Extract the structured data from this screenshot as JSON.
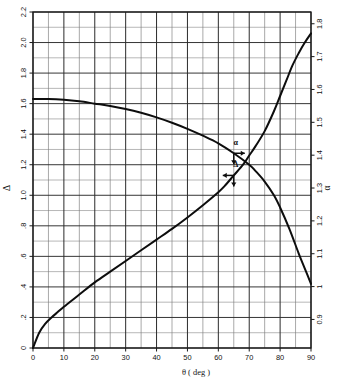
{
  "chart_data": {
    "type": "line",
    "title": "",
    "xlabel": "θ (deg)",
    "ylabel_left": "Δ",
    "ylabel_right": "α",
    "xlim": [
      0,
      90
    ],
    "ylim_left": [
      0,
      2.2
    ],
    "ylim_right": [
      0.9,
      1.82
    ],
    "grid": true,
    "grid_minor": true,
    "x_major_step": 10,
    "x_minor_step": 5,
    "y_left_major_step": 0.2,
    "y_left_minor_step": 0.1,
    "y_right_major_step": 0.1,
    "legend": "none",
    "x_tick_labels": [
      "0",
      "10",
      "20",
      "30",
      "40",
      "50",
      "60",
      "70",
      "80",
      "90"
    ],
    "y_left_tick_labels": [
      "0",
      ".2",
      ".4",
      ".6",
      ".8",
      "1.0",
      "1.2",
      "1.4",
      "1.6",
      "1.8",
      "2.0",
      "2.2"
    ],
    "y_right_tick_labels": [
      "0.9",
      "1",
      "1.1",
      "1.2",
      "1.3",
      "1.4",
      "1.5",
      "1.6",
      "1.7",
      "1.8"
    ],
    "series": [
      {
        "name": "Δ",
        "axis": "left",
        "annotation": "Δ",
        "x": [
          0,
          2,
          4,
          6,
          8,
          10,
          15,
          20,
          25,
          30,
          35,
          40,
          45,
          50,
          55,
          60,
          62,
          65,
          68,
          70,
          72,
          75,
          78,
          80,
          82,
          84,
          86,
          88,
          90
        ],
        "values": [
          0.0,
          0.1,
          0.16,
          0.2,
          0.235,
          0.27,
          0.35,
          0.43,
          0.5,
          0.57,
          0.64,
          0.71,
          0.78,
          0.855,
          0.935,
          1.02,
          1.06,
          1.13,
          1.2,
          1.26,
          1.32,
          1.42,
          1.55,
          1.65,
          1.75,
          1.85,
          1.93,
          2.0,
          2.06
        ]
      },
      {
        "name": "α",
        "axis": "right",
        "annotation": "α",
        "x": [
          0,
          5,
          10,
          15,
          20,
          25,
          30,
          35,
          40,
          45,
          50,
          55,
          60,
          65,
          70,
          72,
          75,
          78,
          80,
          83,
          86,
          88,
          90
        ],
        "values_left_scale": [
          1.63,
          1.63,
          1.625,
          1.615,
          1.6,
          1.585,
          1.565,
          1.54,
          1.51,
          1.475,
          1.435,
          1.39,
          1.34,
          1.275,
          1.2,
          1.16,
          1.09,
          1.0,
          0.92,
          0.78,
          0.62,
          0.52,
          0.42
        ]
      }
    ],
    "annotations": [
      {
        "label": "α",
        "x_deg": 65,
        "y_left": 1.275,
        "arrows": [
          "right",
          "down"
        ]
      },
      {
        "label": "Δ",
        "x_deg": 65,
        "y_left": 1.13,
        "arrows": [
          "left",
          "down"
        ]
      }
    ]
  },
  "axes": {
    "x_title": "θ  ( deg )",
    "left_title": "Δ",
    "right_title": "α"
  }
}
